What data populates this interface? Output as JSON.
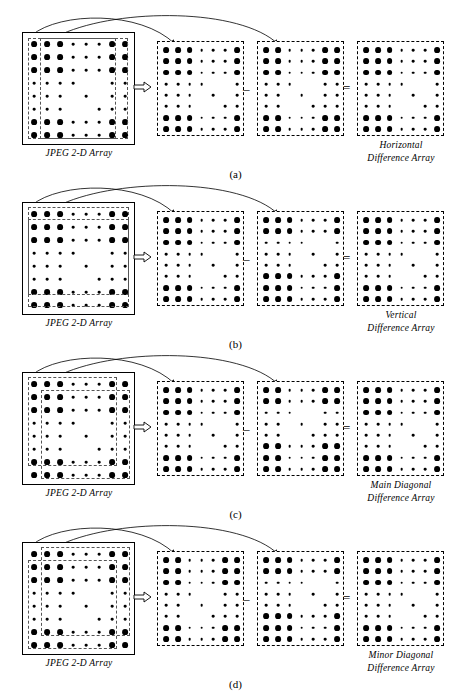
{
  "figure": {
    "width": 471,
    "height": 692,
    "background": "#ffffff",
    "ink_color": "#000000"
  },
  "operators": {
    "implies": "⇒",
    "minus": "–",
    "equals": "="
  },
  "common_labels": {
    "source_caption": "JPEG 2-D Array",
    "difference_word": "Difference  Array"
  },
  "panels": [
    {
      "id": "a",
      "sub_caption": "(a)",
      "source_caption": "JPEG 2-D Array",
      "result_caption_line1": "Horizontal",
      "result_caption_line2": "Difference  Array",
      "direction": "horizontal",
      "top": 0,
      "selection_mode": "columns",
      "boxes": [
        {
          "name": "source-array",
          "style": "solid"
        },
        {
          "name": "operand-array-1",
          "style": "dashed"
        },
        {
          "name": "operand-array-2",
          "style": "dashed"
        },
        {
          "name": "difference-array",
          "style": "dashed"
        }
      ]
    },
    {
      "id": "b",
      "sub_caption": "(b)",
      "source_caption": "JPEG 2-D Array",
      "result_caption_line1": "Vertical",
      "result_caption_line2": "Difference  Array",
      "direction": "vertical",
      "top": 170,
      "selection_mode": "rows",
      "boxes": [
        {
          "name": "source-array",
          "style": "solid"
        },
        {
          "name": "operand-array-1",
          "style": "dashed"
        },
        {
          "name": "operand-array-2",
          "style": "dashed"
        },
        {
          "name": "difference-array",
          "style": "dashed"
        }
      ]
    },
    {
      "id": "c",
      "sub_caption": "(c)",
      "source_caption": "JPEG 2-D Array",
      "result_caption_line1": "Main Diagonal",
      "result_caption_line2": "Difference  Array",
      "direction": "main-diagonal",
      "top": 340,
      "selection_mode": "main-diagonal",
      "boxes": [
        {
          "name": "source-array",
          "style": "solid"
        },
        {
          "name": "operand-array-1",
          "style": "dashed"
        },
        {
          "name": "operand-array-2",
          "style": "dashed"
        },
        {
          "name": "difference-array",
          "style": "dashed"
        }
      ]
    },
    {
      "id": "d",
      "sub_caption": "(d)",
      "source_caption": "JPEG 2-D Array",
      "result_caption_line1": "Minor Diagonal",
      "result_caption_line2": "Difference  Array",
      "direction": "minor-diagonal",
      "top": 510,
      "selection_mode": "minor-diagonal",
      "boxes": [
        {
          "name": "source-array",
          "style": "solid"
        },
        {
          "name": "operand-array-1",
          "style": "dashed"
        },
        {
          "name": "operand-array-2",
          "style": "dashed"
        },
        {
          "name": "difference-array",
          "style": "dashed"
        }
      ]
    }
  ],
  "chart_data": {
    "type": "heatmap",
    "xlabel": "",
    "ylabel": "",
    "rows": 8,
    "cols": 8,
    "legend": "dot radius encodes coefficient magnitude (3 = large, 2 = medium, 1 = small)",
    "magnitude_scale": {
      "3": "large",
      "2": "medium",
      "1": "small"
    },
    "values": [
      [
        3,
        3,
        3,
        1,
        1,
        1,
        3,
        3
      ],
      [
        3,
        3,
        3,
        1,
        1,
        1,
        3,
        3
      ],
      [
        3,
        3,
        3,
        1,
        1,
        1,
        3,
        3
      ],
      [
        1,
        1,
        1,
        1,
        0,
        0,
        1,
        1
      ],
      [
        1,
        1,
        1,
        0,
        1,
        0,
        1,
        1
      ],
      [
        1,
        1,
        1,
        0,
        0,
        1,
        1,
        1
      ],
      [
        3,
        3,
        3,
        1,
        1,
        1,
        3,
        3
      ],
      [
        3,
        3,
        3,
        1,
        1,
        1,
        3,
        3
      ]
    ]
  }
}
